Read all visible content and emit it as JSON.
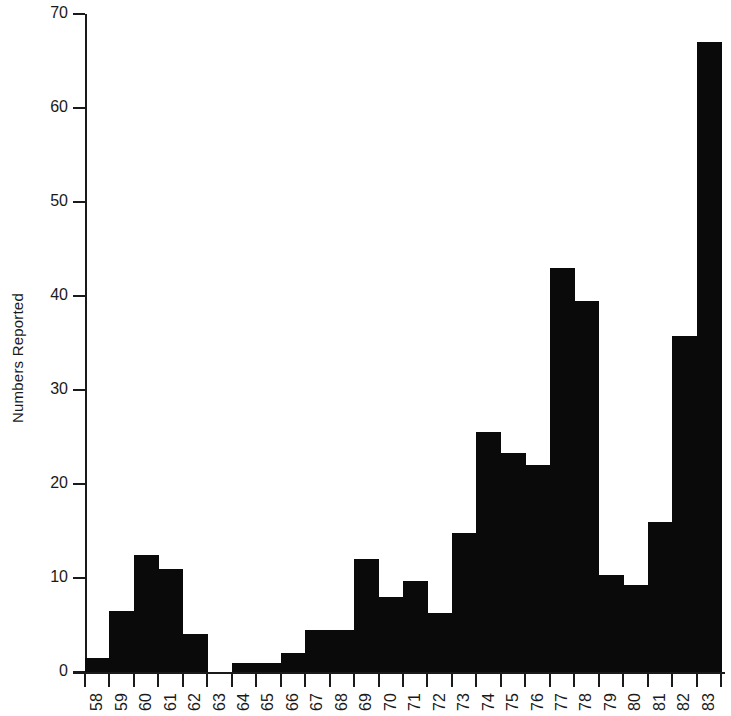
{
  "chart_data": {
    "type": "bar",
    "title": "",
    "xlabel": "",
    "ylabel": "Numbers Reported",
    "ylim": [
      0,
      70
    ],
    "ytick_values": [
      0,
      10,
      20,
      30,
      40,
      50,
      60,
      70
    ],
    "ytick_labels": [
      "0",
      "10",
      "20",
      "30",
      "40",
      "50",
      "60",
      "70"
    ],
    "grid": false,
    "legend": null,
    "bar_color": "#0a0a0a",
    "axis_color": "#1a1a1a",
    "background": "#ffffff",
    "categories": [
      "58",
      "59",
      "60",
      "61",
      "62",
      "63",
      "64",
      "65",
      "66",
      "67",
      "68",
      "69",
      "70",
      "71",
      "72",
      "73",
      "74",
      "75",
      "76",
      "77",
      "78",
      "79",
      "80",
      "81",
      "82",
      "83"
    ],
    "values": [
      1.5,
      6.5,
      12.5,
      11,
      4,
      0,
      1,
      1,
      2,
      4.5,
      4.5,
      12,
      8,
      9.7,
      6.3,
      14.8,
      25.5,
      23.3,
      22,
      43,
      39.5,
      10.3,
      9.3,
      16,
      35.7,
      67
    ]
  }
}
